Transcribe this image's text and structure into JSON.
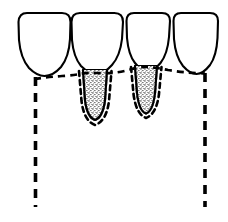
{
  "figure": {
    "title": "Dental cross-section diagram",
    "type": "line-drawing",
    "width": 228,
    "height": 222,
    "background_color": "#ffffff",
    "stroke_color": "#000000"
  },
  "style": {
    "ink": "#000000",
    "paper": "#ffffff",
    "crown_stroke_width": 2.0,
    "root_stroke_width": 2.0,
    "gumline_stroke_width": 2.6,
    "gumline_dash": "7 5",
    "box_stroke_width": 3.4,
    "box_dash": "9 7",
    "root_dash": "5 4"
  },
  "teeth": [
    {
      "id": "tooth-1",
      "label": "Tooth 1",
      "position": "left",
      "crown": {
        "left": 18,
        "right": 70,
        "top": 12,
        "neck_y": 74,
        "apex_x": 44,
        "corner_radius": 9
      },
      "has_exposed_root": false,
      "root": null
    },
    {
      "id": "tooth-2",
      "label": "Tooth 2",
      "position": "center-left",
      "crown": {
        "left": 71,
        "right": 124,
        "top": 12,
        "neck_y": 72,
        "apex_x": 97,
        "corner_radius": 9
      },
      "has_exposed_root": true,
      "root": {
        "top_y": 72,
        "tip_y": 122,
        "top_half_width": 13,
        "tip_half_width": 7,
        "center_x": 95,
        "stippled": true,
        "outlined_by_dashes": true
      }
    },
    {
      "id": "tooth-3",
      "label": "Tooth 3",
      "position": "center-right",
      "crown": {
        "left": 126,
        "right": 172,
        "top": 12,
        "neck_y": 70,
        "apex_x": 148,
        "corner_radius": 9
      },
      "has_exposed_root": true,
      "root": {
        "top_y": 68,
        "tip_y": 115,
        "top_half_width": 12,
        "tip_half_width": 6,
        "center_x": 146,
        "stippled": true,
        "outlined_by_dashes": true
      }
    },
    {
      "id": "tooth-4",
      "label": "Tooth 4",
      "position": "right",
      "crown": {
        "left": 173,
        "right": 218,
        "top": 12,
        "neck_y": 71,
        "apex_x": 196,
        "corner_radius": 9
      },
      "has_exposed_root": false,
      "root": null
    }
  ],
  "gumline": {
    "id": "gumline",
    "label": "Dashed gingival / scalloped contour line",
    "dashed": true,
    "path_points": [
      {
        "x": 34,
        "y": 78
      },
      {
        "x": 55,
        "y": 76
      },
      {
        "x": 78,
        "y": 74
      },
      {
        "x": 95,
        "y": 73
      },
      {
        "x": 112,
        "y": 73
      },
      {
        "x": 128,
        "y": 70
      },
      {
        "x": 146,
        "y": 68
      },
      {
        "x": 164,
        "y": 70
      },
      {
        "x": 186,
        "y": 72
      },
      {
        "x": 205,
        "y": 73
      }
    ]
  },
  "outline_box": {
    "id": "outline-box",
    "label": "Dashed boundary outline open at bottom",
    "dashed": true,
    "left_x": 35,
    "right_x": 205,
    "top_y": 77,
    "bottom_y": 207,
    "open_at_bottom": true
  }
}
